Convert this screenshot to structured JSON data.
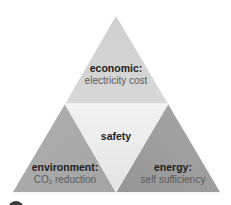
{
  "diagram": {
    "type": "triangle-of-four",
    "colors": {
      "top": "#d3d3d3",
      "left": "#a9a9a9",
      "right": "#9d9d9d",
      "center": "#ececec",
      "edge_light": "#f5f5f5",
      "title_text": "#1e1e1e",
      "subtitle_text": "#5a5a5a"
    },
    "segments": {
      "top": {
        "title": "economic:",
        "subtitle": "electricity cost"
      },
      "center": {
        "title": "safety"
      },
      "left": {
        "title": "environment:",
        "subtitle_prefix": "CO",
        "subtitle_sub": "2",
        "subtitle_suffix": " reduction"
      },
      "right": {
        "title": "energy:",
        "subtitle": "self sufficiency"
      }
    }
  }
}
